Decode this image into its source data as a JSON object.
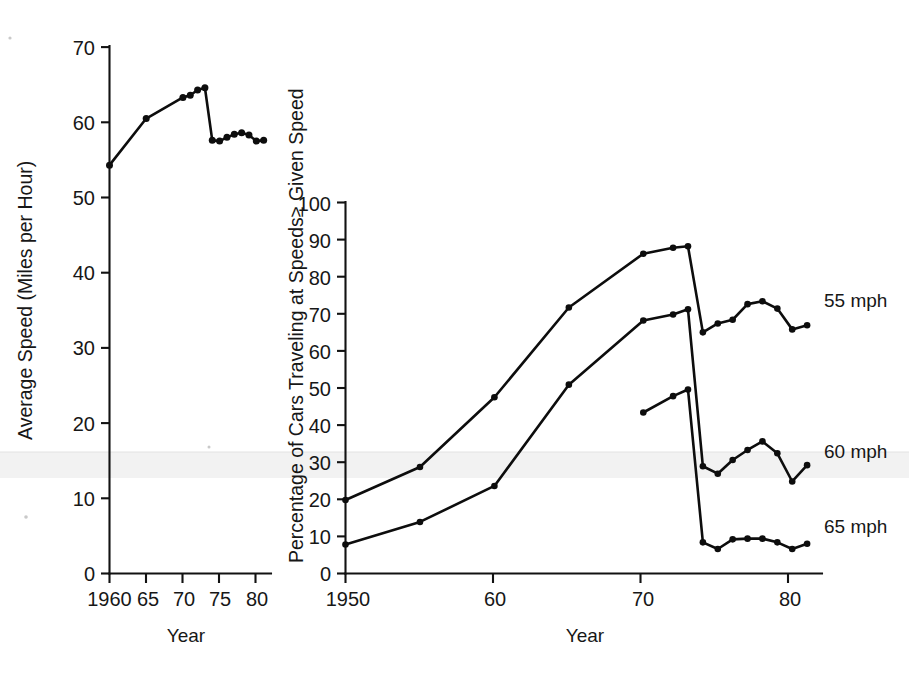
{
  "figure": {
    "background": "#ffffff",
    "ink_color": "#0d0d0d"
  },
  "left_chart": {
    "ylabel": "Average Speed (Miles per Hour)",
    "xlabel": "Year",
    "y_ticks": [
      "0",
      "10",
      "20",
      "30",
      "40",
      "50",
      "60",
      "70"
    ],
    "x_ticks": [
      "1960",
      "65",
      "70",
      "75",
      "80"
    ]
  },
  "right_chart": {
    "ylabel": "Percentage of Cars Traveling at Speeds≥ Given Speed",
    "xlabel": "Year",
    "y_ticks": [
      "0",
      "10",
      "20",
      "30",
      "40",
      "50",
      "60",
      "70",
      "80",
      "90",
      "100"
    ],
    "x_ticks": [
      "1950",
      "60",
      "70",
      "80"
    ],
    "series_labels": [
      "55 mph",
      "60 mph",
      "65 mph"
    ]
  },
  "chart_data": [
    {
      "type": "line",
      "panel": "left",
      "title": "",
      "xlabel": "Year",
      "ylabel": "Average Speed (Miles per Hour)",
      "xlim": [
        1960,
        1982
      ],
      "ylim": [
        0,
        70
      ],
      "xticks": [
        1960,
        1965,
        1970,
        1975,
        1980
      ],
      "xticklabels": [
        "1960",
        "65",
        "70",
        "75",
        "80"
      ],
      "yticks": [
        0,
        10,
        20,
        30,
        40,
        50,
        60,
        70
      ],
      "grid": false,
      "legend": "none",
      "markers": "filled-circle",
      "series": [
        {
          "name": "Average speed",
          "x": [
            1960,
            1965,
            1970,
            1971,
            1972,
            1973,
            1974,
            1975,
            1976,
            1977,
            1978,
            1979,
            1980,
            1981
          ],
          "values": [
            54.3,
            60.5,
            63.3,
            63.6,
            64.3,
            64.6,
            57.6,
            57.5,
            58.0,
            58.4,
            58.6,
            58.3,
            57.5,
            57.6
          ]
        }
      ]
    },
    {
      "type": "line",
      "panel": "right",
      "title": "",
      "xlabel": "Year",
      "ylabel": "Percentage of Cars Traveling at Speeds≥ Given Speed",
      "xlim": [
        1950,
        1982
      ],
      "ylim": [
        0,
        100
      ],
      "xticks": [
        1950,
        1960,
        1970,
        1980
      ],
      "xticklabels": [
        "1950",
        "60",
        "70",
        "80"
      ],
      "yticks": [
        0,
        10,
        20,
        30,
        40,
        50,
        60,
        70,
        80,
        90,
        100
      ],
      "grid": false,
      "legend": "right-of-line-ends",
      "markers": "filled-circle",
      "series": [
        {
          "name": "55 mph",
          "label": "55 mph",
          "x": [
            1950,
            1955,
            1960,
            1965,
            1970,
            1972,
            1973,
            1974,
            1975,
            1976,
            1977,
            1978,
            1979,
            1980,
            1981
          ],
          "values": [
            19.8,
            28.7,
            47.5,
            71.7,
            86.2,
            87.8,
            88.2,
            65.0,
            67.4,
            68.4,
            72.6,
            73.4,
            71.4,
            65.8,
            66.9
          ]
        },
        {
          "name": "60 mph",
          "label": "60 mph",
          "x": [
            1950,
            1955,
            1960,
            1965,
            1970,
            1972,
            1973,
            1974,
            1975,
            1976,
            1977,
            1978,
            1979,
            1980,
            1981
          ],
          "values": [
            7.8,
            13.9,
            23.6,
            50.9,
            68.2,
            69.8,
            71.2,
            28.9,
            26.9,
            30.6,
            33.3,
            35.6,
            32.4,
            24.8,
            29.2
          ]
        },
        {
          "name": "65 mph",
          "label": "65 mph",
          "x": [
            1970,
            1972,
            1973,
            1974,
            1975,
            1976,
            1977,
            1978,
            1979,
            1980,
            1981
          ],
          "values": [
            43.4,
            47.8,
            49.6,
            8.4,
            6.6,
            9.2,
            9.4,
            9.4,
            8.4,
            6.6,
            8.0
          ]
        }
      ]
    }
  ]
}
